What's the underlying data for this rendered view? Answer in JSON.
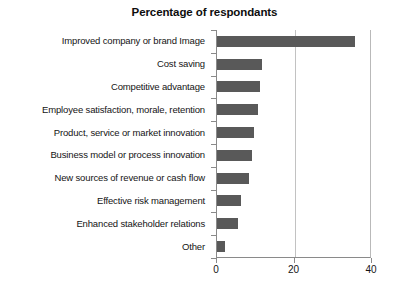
{
  "chart_data": {
    "type": "bar",
    "orientation": "horizontal",
    "title": "Percentage of respondants",
    "xlabel": "",
    "ylabel": "",
    "categories": [
      "Improved company or brand Image",
      "Cost saving",
      "Competitive advantage",
      "Employee satisfaction, morale, retention",
      "Product, service or market innovation",
      "Business model or process innovation",
      "New sources of revenue or cash flow",
      "Effective risk management",
      "Enhanced stakeholder relations",
      "Other"
    ],
    "values": [
      35.5,
      11.5,
      11,
      10.5,
      9.5,
      9,
      8.3,
      6.2,
      5.3,
      2
    ],
    "xlim": [
      0,
      40
    ],
    "xticks": [
      0,
      20,
      40
    ],
    "xtick_labels": [
      "0",
      "20",
      "40"
    ],
    "grid": true,
    "gridlines_at": [
      20
    ],
    "legend": null,
    "bar_color": "#595959",
    "axis_color": "#8a8a8a",
    "grid_color": "#c2c2c2",
    "background": "#ffffff"
  }
}
